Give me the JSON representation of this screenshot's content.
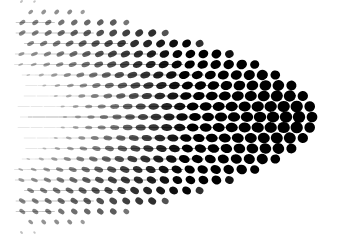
{
  "image": {
    "description": "Abstract black halftone dot pattern on white, dots enlarge and darken toward the right forming a curved bulge, fading to thin sparse marks toward the left and edges",
    "background": "#ffffff",
    "ink": "#000000",
    "width": 353,
    "height": 244
  },
  "pattern": {
    "center_x": 300,
    "center_y": 117,
    "col_spacing": 13,
    "row_spacing": 10.5,
    "cols": 24,
    "rows_half": 11,
    "max_radius": 6.2,
    "right_edge_x": 312,
    "curve_strength": 0.0016
  }
}
